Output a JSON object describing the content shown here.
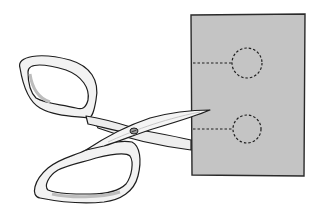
{
  "illustration": {
    "subject": "scissors cutting paper",
    "colors": {
      "background": "#ffffff",
      "paper": "#c4c4c4",
      "paper_edge": "#2a2a2a",
      "scissors_fill": "#f2f2f2",
      "scissors_shade": "#cfcfcf",
      "outline": "#1e1e1e",
      "dash": "#1e1e1e"
    },
    "paper": {
      "x": 191,
      "y": 14,
      "width": 114,
      "height": 162
    },
    "cut_guides": [
      {
        "line_from_x": 193,
        "line_to_x": 232,
        "y": 63,
        "circle_cx": 247,
        "circle_cy": 63,
        "r": 15
      },
      {
        "line_from_x": 193,
        "line_to_x": 233,
        "y": 129,
        "circle_cx": 247,
        "circle_cy": 129,
        "r": 14
      }
    ],
    "scissors": {
      "pivot": {
        "x": 134,
        "y": 131
      },
      "tip": {
        "x": 210,
        "y": 110
      }
    }
  }
}
